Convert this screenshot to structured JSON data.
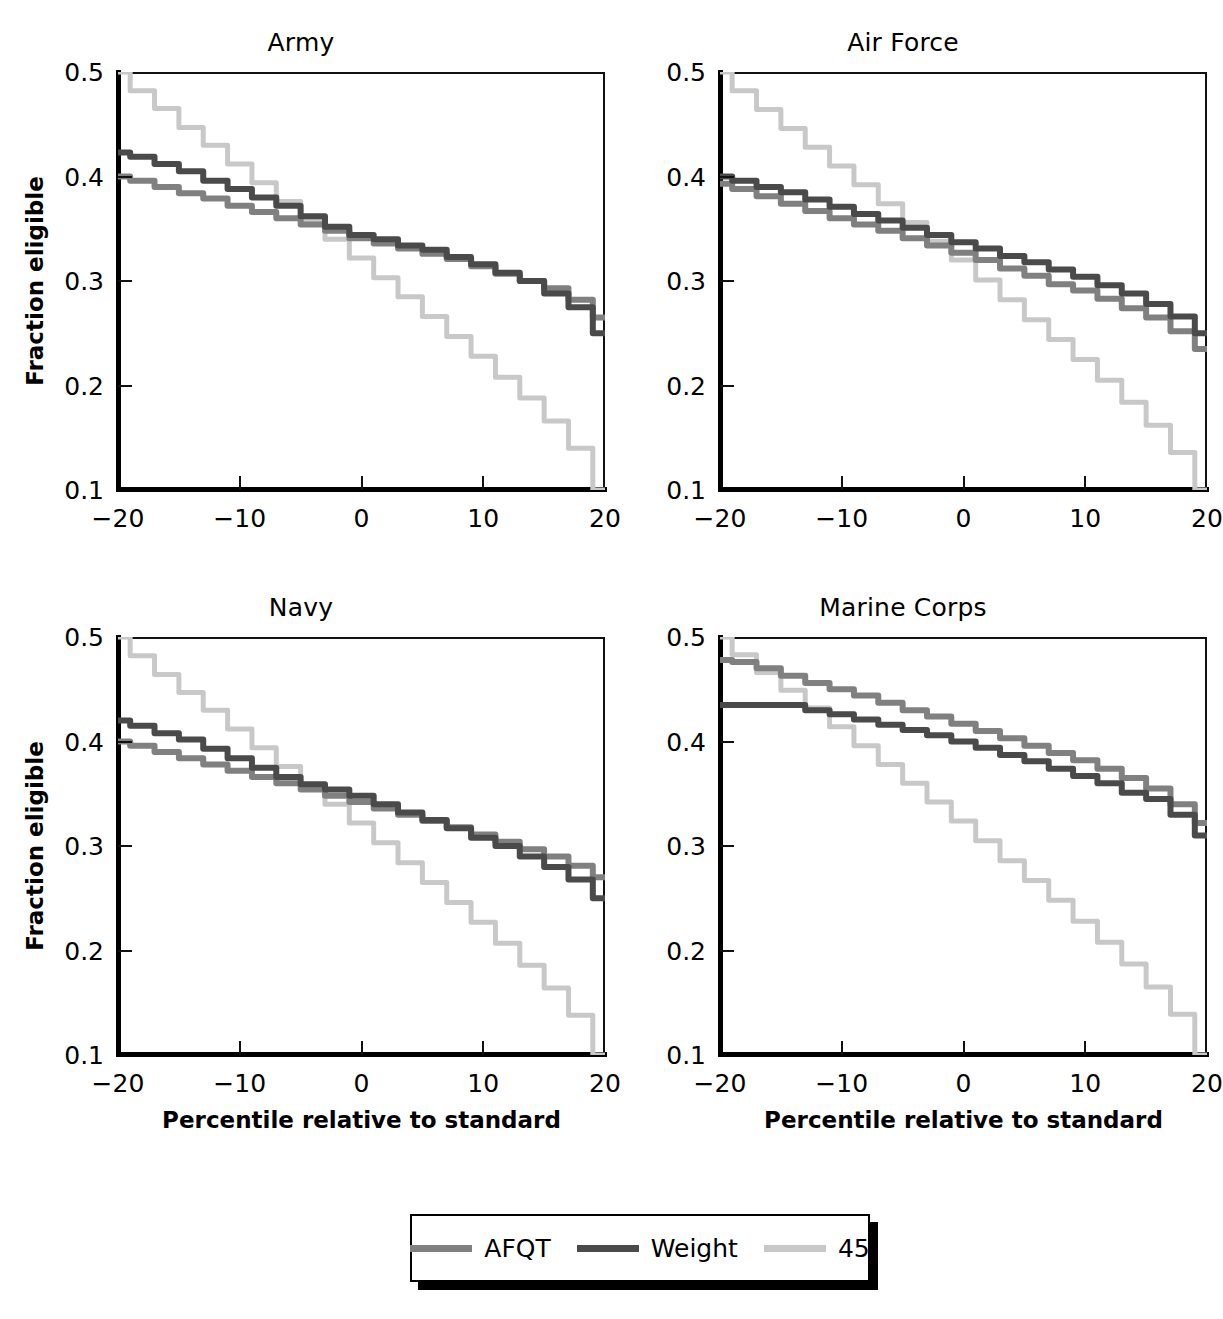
{
  "chart_data": {
    "type": "line",
    "layout": "2x2 small multiples",
    "title": "",
    "xlabel": "Percentile relative to standard",
    "ylabel": "Fraction eligible",
    "xlim": [
      -20,
      20
    ],
    "ylim": [
      0.1,
      0.5
    ],
    "xticks": [
      -20,
      -10,
      0,
      10,
      20
    ],
    "xtick_labels": [
      "−20",
      "−10",
      "0",
      "10",
      "20"
    ],
    "yticks": [
      0.1,
      0.2,
      0.3,
      0.4,
      0.5
    ],
    "ytick_labels": [
      "0.1",
      "0.2",
      "0.3",
      "0.4",
      "0.5"
    ],
    "grid": false,
    "legend_position": "bottom-center",
    "x": [
      -20,
      -18,
      -16,
      -14,
      -12,
      -10,
      -8,
      -6,
      -4,
      -2,
      0,
      2,
      4,
      6,
      8,
      10,
      12,
      14,
      16,
      18,
      20
    ],
    "series_colors": {
      "AFQT": "#808080",
      "Weight": "#4a4a4a",
      "45": "#c8c8c8"
    },
    "panels": [
      {
        "title": "Army",
        "series": [
          {
            "name": "AFQT",
            "values": [
              0.4,
              0.396,
              0.39,
              0.384,
              0.379,
              0.372,
              0.366,
              0.36,
              0.354,
              0.348,
              0.341,
              0.336,
              0.331,
              0.326,
              0.321,
              0.314,
              0.307,
              0.3,
              0.293,
              0.282,
              0.265
            ]
          },
          {
            "name": "Weight",
            "values": [
              0.423,
              0.419,
              0.412,
              0.405,
              0.396,
              0.388,
              0.38,
              0.372,
              0.362,
              0.352,
              0.344,
              0.34,
              0.334,
              0.33,
              0.323,
              0.316,
              0.308,
              0.3,
              0.288,
              0.275,
              0.25
            ]
          },
          {
            "name": "45",
            "values": [
              0.5,
              0.482,
              0.465,
              0.447,
              0.43,
              0.412,
              0.394,
              0.376,
              0.358,
              0.34,
              0.322,
              0.303,
              0.285,
              0.266,
              0.247,
              0.228,
              0.208,
              0.188,
              0.166,
              0.14,
              0.1
            ]
          }
        ]
      },
      {
        "title": "Air Force",
        "series": [
          {
            "name": "AFQT",
            "values": [
              0.393,
              0.388,
              0.381,
              0.374,
              0.367,
              0.36,
              0.354,
              0.348,
              0.341,
              0.334,
              0.327,
              0.32,
              0.312,
              0.305,
              0.297,
              0.291,
              0.283,
              0.274,
              0.265,
              0.252,
              0.235
            ]
          },
          {
            "name": "Weight",
            "values": [
              0.4,
              0.396,
              0.39,
              0.385,
              0.378,
              0.371,
              0.364,
              0.358,
              0.351,
              0.344,
              0.337,
              0.331,
              0.324,
              0.318,
              0.311,
              0.304,
              0.296,
              0.288,
              0.278,
              0.266,
              0.25
            ]
          },
          {
            "name": "45",
            "values": [
              0.5,
              0.482,
              0.464,
              0.446,
              0.428,
              0.41,
              0.392,
              0.374,
              0.356,
              0.338,
              0.32,
              0.301,
              0.282,
              0.263,
              0.244,
              0.225,
              0.205,
              0.184,
              0.162,
              0.136,
              0.1
            ]
          }
        ]
      },
      {
        "title": "Navy",
        "series": [
          {
            "name": "AFQT",
            "values": [
              0.4,
              0.396,
              0.39,
              0.384,
              0.378,
              0.372,
              0.366,
              0.36,
              0.354,
              0.348,
              0.342,
              0.336,
              0.33,
              0.324,
              0.318,
              0.311,
              0.304,
              0.297,
              0.29,
              0.281,
              0.27
            ]
          },
          {
            "name": "Weight",
            "values": [
              0.42,
              0.415,
              0.408,
              0.402,
              0.393,
              0.384,
              0.375,
              0.366,
              0.359,
              0.354,
              0.348,
              0.34,
              0.332,
              0.325,
              0.317,
              0.308,
              0.3,
              0.29,
              0.28,
              0.268,
              0.25
            ]
          },
          {
            "name": "45",
            "values": [
              0.5,
              0.482,
              0.464,
              0.447,
              0.43,
              0.412,
              0.394,
              0.376,
              0.358,
              0.34,
              0.322,
              0.303,
              0.284,
              0.265,
              0.246,
              0.227,
              0.207,
              0.186,
              0.164,
              0.138,
              0.1
            ]
          }
        ]
      },
      {
        "title": "Marine Corps",
        "series": [
          {
            "name": "AFQT",
            "values": [
              0.478,
              0.476,
              0.47,
              0.463,
              0.456,
              0.45,
              0.444,
              0.437,
              0.43,
              0.424,
              0.417,
              0.41,
              0.403,
              0.396,
              0.389,
              0.382,
              0.374,
              0.365,
              0.355,
              0.34,
              0.322
            ]
          },
          {
            "name": "Weight",
            "values": [
              0.435,
              0.435,
              0.435,
              0.435,
              0.43,
              0.426,
              0.421,
              0.416,
              0.411,
              0.406,
              0.4,
              0.394,
              0.387,
              0.381,
              0.374,
              0.367,
              0.36,
              0.351,
              0.345,
              0.33,
              0.31
            ]
          },
          {
            "name": "45",
            "values": [
              0.5,
              0.483,
              0.466,
              0.449,
              0.432,
              0.414,
              0.396,
              0.378,
              0.36,
              0.342,
              0.324,
              0.305,
              0.286,
              0.267,
              0.248,
              0.228,
              0.208,
              0.187,
              0.165,
              0.139,
              0.1
            ]
          }
        ]
      }
    ],
    "legend": [
      {
        "label": "AFQT",
        "color": "#808080"
      },
      {
        "label": "Weight",
        "color": "#4a4a4a"
      },
      {
        "label": "45",
        "color": "#c8c8c8"
      }
    ]
  }
}
